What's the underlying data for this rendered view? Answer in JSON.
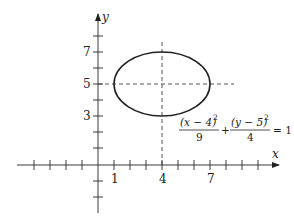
{
  "diagram": {
    "type": "ellipse-graph",
    "axes": {
      "x_label": "x",
      "y_label": "y",
      "x_tick_labels": [
        "1",
        "4",
        "7"
      ],
      "y_tick_labels": [
        "7",
        "5",
        "3"
      ]
    },
    "ellipse": {
      "center": [
        4,
        5
      ],
      "semi_axis_x": 3,
      "semi_axis_y": 2
    },
    "equation": {
      "term1_numerator": "(x − 4)",
      "term1_exponent": "2",
      "term1_denominator": "9",
      "plus": "+",
      "term2_numerator": "(y − 5)",
      "term2_exponent": "2",
      "term2_denominator": "4",
      "equals": "= 1"
    },
    "colors": {
      "stroke": "#222222",
      "background": "#ffffff"
    }
  }
}
